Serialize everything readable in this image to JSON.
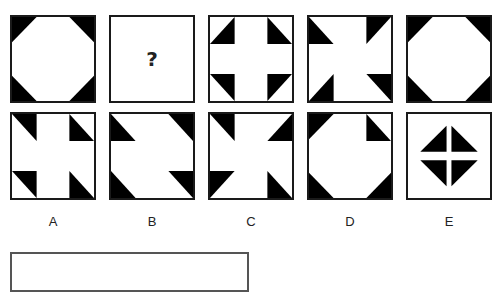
{
  "puzzle": {
    "sequence": [
      {
        "id": "seq-1",
        "pattern": "octagon-corners"
      },
      {
        "id": "seq-2",
        "pattern": "unknown",
        "text": "?"
      },
      {
        "id": "seq-3",
        "pattern": "cross-notches"
      },
      {
        "id": "seq-4",
        "pattern": "pinwheel"
      },
      {
        "id": "seq-5",
        "pattern": "octagon-corners"
      }
    ],
    "options": [
      {
        "label": "A",
        "pattern": "variant-a"
      },
      {
        "label": "B",
        "pattern": "variant-b"
      },
      {
        "label": "C",
        "pattern": "variant-c"
      },
      {
        "label": "D",
        "pattern": "variant-d"
      },
      {
        "label": "E",
        "pattern": "inner-diamond"
      }
    ],
    "answer_box": {
      "value": ""
    }
  },
  "colors": {
    "fill": "#000000",
    "border": "#1a1a1a",
    "background": "#ffffff"
  }
}
